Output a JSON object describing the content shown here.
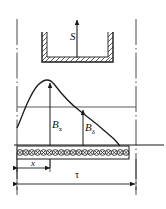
{
  "figure": {
    "name": "magnetic-flux-density-distribution-diagram",
    "type": "diagram",
    "background_color": "#ffffff",
    "line_color": "#1a1a1a",
    "width": 166,
    "height": 209
  },
  "labels": {
    "pole_motion_arrow": "S",
    "flux_density_at_x": "B",
    "flux_density_at_x_sub": "x",
    "air_gap_flux_density": "B",
    "air_gap_flux_density_sub": "δ",
    "position_dimension": "x",
    "pole_pitch_dimension": "τ"
  },
  "elements": {
    "pole_shoe": "hatched-U-channel",
    "conductor_row_symbol": "⊗",
    "conductor_count": 19,
    "curve": "flux-density-waveform",
    "baseline": "armature-surface-line",
    "level_line": "mean-flux-density-line",
    "centerline_style": "dash-dot"
  },
  "chart_data": {
    "type": "line",
    "title": "",
    "xlabel": "x",
    "ylabel": "B",
    "annotations": [
      "S",
      "B_x",
      "B_δ",
      "x",
      "τ"
    ],
    "x": [
      0,
      6,
      12,
      18,
      24,
      30,
      36,
      42,
      48,
      54,
      60,
      66,
      72,
      78,
      84,
      90,
      96,
      100
    ],
    "values": [
      -22,
      -6,
      10,
      24,
      33,
      38,
      40,
      39,
      36,
      32,
      28,
      23,
      18,
      12,
      5,
      -3,
      -12,
      -20
    ],
    "xlim": [
      0,
      100
    ],
    "ylim": [
      -30,
      45
    ],
    "grid": false,
    "legend": false
  }
}
